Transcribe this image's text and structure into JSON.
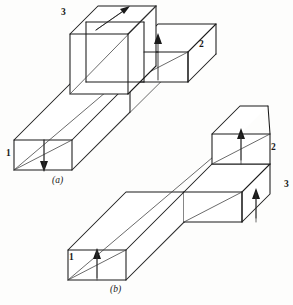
{
  "figure": {
    "background_color": "#fdfdfc",
    "line_color": "#1a1a1a",
    "views": [
      {
        "id": "a",
        "caption": "(a)",
        "caption_x": 52,
        "caption_y": 176,
        "description": "Isometric view of an L-shaped stepped block with the tall cube block at upper left",
        "labels": [
          {
            "text": "3",
            "x": 61,
            "y": 8,
            "face": "top-face-of-upright-block"
          },
          {
            "text": "2",
            "x": 199,
            "y": 40,
            "face": "front-face-of-right-arm"
          },
          {
            "text": "1",
            "x": 6,
            "y": 149,
            "face": "left-end-face-of-long-bar"
          }
        ],
        "arrows": [
          {
            "name": "arrow-face-3",
            "direction": "up-right",
            "face": "3"
          },
          {
            "name": "arrow-face-2",
            "direction": "up",
            "face": "2"
          },
          {
            "name": "arrow-face-1",
            "direction": "down",
            "face": "1"
          }
        ]
      },
      {
        "id": "b",
        "caption": "(b)",
        "caption_x": 110,
        "caption_y": 285,
        "description": "Isometric view of the same block rotated, stepped block at the right end",
        "labels": [
          {
            "text": "2",
            "x": 271,
            "y": 143,
            "face": "front-face-of-upper-step"
          },
          {
            "text": "3",
            "x": 284,
            "y": 180,
            "face": "front-face-of-lower-step"
          },
          {
            "text": "1",
            "x": 69,
            "y": 253,
            "face": "left-end-face-of-long-bar"
          }
        ],
        "arrows": [
          {
            "name": "arrow-face-2",
            "direction": "up",
            "face": "2"
          },
          {
            "name": "arrow-face-3",
            "direction": "up",
            "face": "3"
          },
          {
            "name": "arrow-face-1",
            "direction": "up",
            "face": "1"
          }
        ]
      }
    ]
  }
}
